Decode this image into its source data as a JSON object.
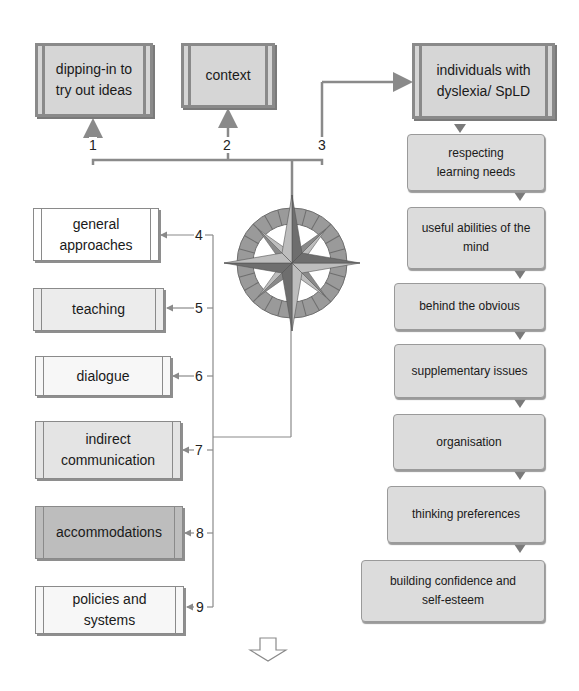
{
  "top_boxes": [
    {
      "label": "dipping-in to try out ideas",
      "number": "1"
    },
    {
      "label": "context",
      "number": "2"
    },
    {
      "label": "individuals with dyslexia/ SpLD",
      "number": "3"
    }
  ],
  "left_boxes": [
    {
      "label": "general approaches",
      "number": "4"
    },
    {
      "label": "teaching",
      "number": "5"
    },
    {
      "label": "dialogue",
      "number": "6"
    },
    {
      "label": "indirect communication",
      "number": "7"
    },
    {
      "label": "accommodations",
      "number": "8"
    },
    {
      "label": "policies and systems",
      "number": "9"
    }
  ],
  "right_chain": [
    {
      "label": "respecting learning needs"
    },
    {
      "label": "useful abilities of the mind"
    },
    {
      "label": "behind the obvious"
    },
    {
      "label": "supplementary issues"
    },
    {
      "label": "organisation"
    },
    {
      "label": "thinking preferences"
    },
    {
      "label": "building confidence and self-esteem"
    }
  ],
  "icons": {
    "center": "compass-rose-icon",
    "bottom": "down-arrow-icon"
  },
  "colors": {
    "line": "#8a8a8a",
    "box_fill_dark": "#bdbdbd",
    "box_fill_mid": "#d9d9d9",
    "box_fill_light": "#ececec",
    "box_fill_white": "#f7f7f7"
  }
}
